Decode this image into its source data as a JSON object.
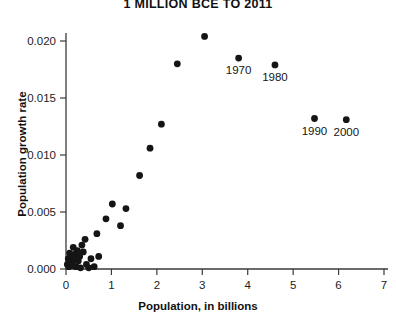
{
  "chart_data": {
    "type": "scatter",
    "title": "1 MILLION BCE TO 2011",
    "xlabel": "Population, in billions",
    "ylabel": "Population growth rate",
    "xlim": [
      0,
      7
    ],
    "ylim": [
      0.0,
      0.0215
    ],
    "xticks": [
      0,
      1,
      2,
      3,
      4,
      5,
      6,
      7
    ],
    "xtick_labels": [
      "0",
      "1",
      "2",
      "3",
      "4",
      "5",
      "6",
      "7"
    ],
    "yticks": [
      0.0,
      0.005,
      0.01,
      0.015,
      0.02
    ],
    "ytick_labels": [
      "0.000",
      "0.005",
      "0.010",
      "0.015",
      "0.020"
    ],
    "grid": false,
    "legend": null,
    "marker": "filled-circle",
    "marker_color": "#151515",
    "points": [
      {
        "x": 0.03,
        "y": 0.0004
      },
      {
        "x": 0.05,
        "y": 0.0009
      },
      {
        "x": 0.06,
        "y": 0.0002
      },
      {
        "x": 0.08,
        "y": 0.0014
      },
      {
        "x": 0.1,
        "y": 0.0006
      },
      {
        "x": 0.12,
        "y": 0.0011
      },
      {
        "x": 0.14,
        "y": 0.0003
      },
      {
        "x": 0.16,
        "y": 0.0019
      },
      {
        "x": 0.18,
        "y": 0.0008
      },
      {
        "x": 0.2,
        "y": 0.0013
      },
      {
        "x": 0.22,
        "y": 0.0002
      },
      {
        "x": 0.25,
        "y": 0.0016
      },
      {
        "x": 0.27,
        "y": 0.0007
      },
      {
        "x": 0.3,
        "y": 0.0011
      },
      {
        "x": 0.32,
        "y": 0.0001
      },
      {
        "x": 0.35,
        "y": 0.0021
      },
      {
        "x": 0.38,
        "y": 0.0015
      },
      {
        "x": 0.42,
        "y": 0.0026
      },
      {
        "x": 0.45,
        "y": 0.0004
      },
      {
        "x": 0.5,
        "y": 0.0001
      },
      {
        "x": 0.55,
        "y": 0.0009
      },
      {
        "x": 0.62,
        "y": 0.0002
      },
      {
        "x": 0.68,
        "y": 0.0031
      },
      {
        "x": 0.72,
        "y": 0.0011
      },
      {
        "x": 0.88,
        "y": 0.0044
      },
      {
        "x": 1.02,
        "y": 0.0057
      },
      {
        "x": 1.2,
        "y": 0.0038
      },
      {
        "x": 1.32,
        "y": 0.0053
      },
      {
        "x": 1.62,
        "y": 0.0082
      },
      {
        "x": 1.85,
        "y": 0.0106
      },
      {
        "x": 2.1,
        "y": 0.0127
      },
      {
        "x": 2.45,
        "y": 0.018
      },
      {
        "x": 3.05,
        "y": 0.0204
      },
      {
        "x": 3.8,
        "y": 0.0185,
        "label": "1970"
      },
      {
        "x": 4.6,
        "y": 0.0179,
        "label": "1980"
      },
      {
        "x": 5.47,
        "y": 0.0132,
        "label": "1990"
      },
      {
        "x": 6.17,
        "y": 0.0131,
        "label": "2000"
      }
    ]
  }
}
